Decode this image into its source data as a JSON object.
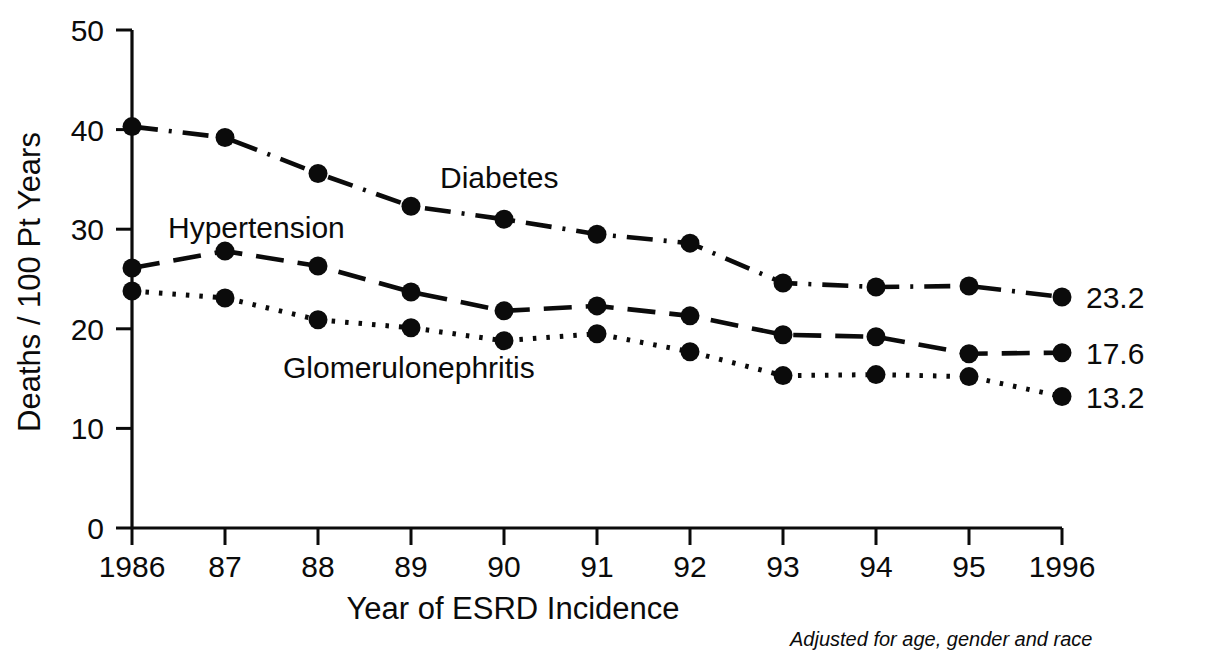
{
  "chart_data": {
    "type": "line",
    "title": "",
    "xlabel": "Year of ESRD Incidence",
    "ylabel": "Deaths / 100 Pt Years",
    "footnote": "Adjusted for age, gender and race",
    "x": [
      1986,
      1987,
      1988,
      1989,
      1990,
      1991,
      1992,
      1993,
      1994,
      1995,
      1996
    ],
    "categories": [
      "1986",
      "87",
      "88",
      "89",
      "90",
      "91",
      "92",
      "93",
      "94",
      "95",
      "1996"
    ],
    "xlim": [
      1986,
      1996
    ],
    "ylim": [
      0,
      50
    ],
    "yticks": [
      "0",
      "10",
      "20",
      "30",
      "40",
      "50"
    ],
    "ytick_values": [
      0,
      10,
      20,
      30,
      40,
      50
    ],
    "grid": false,
    "legend_position": "inline-annotations",
    "series": [
      {
        "name": "Diabetes",
        "line_style": "dash-dot",
        "end_label": "23.2",
        "values": [
          40.3,
          39.2,
          35.6,
          32.3,
          31.0,
          29.5,
          28.6,
          24.6,
          24.2,
          24.3,
          23.2
        ]
      },
      {
        "name": "Hypertension",
        "line_style": "dashed",
        "end_label": "17.6",
        "values": [
          26.1,
          27.8,
          26.3,
          23.7,
          21.8,
          22.3,
          21.3,
          19.4,
          19.2,
          17.5,
          17.6
        ]
      },
      {
        "name": "Glomerulonephritis",
        "line_style": "dotted",
        "end_label": "13.2",
        "values": [
          23.8,
          23.1,
          20.9,
          20.1,
          18.8,
          19.5,
          17.7,
          15.3,
          15.4,
          15.2,
          13.2
        ]
      }
    ],
    "annotations": [
      {
        "text": "Diabetes",
        "x_px": 440,
        "y_px": 188
      },
      {
        "text": "Hypertension",
        "x_px": 168,
        "y_px": 238
      },
      {
        "text": "Glomerulonephritis",
        "x_px": 283,
        "y_px": 378
      }
    ],
    "colors": {
      "ink": "#0b0b0b",
      "background": "#ffffff"
    }
  }
}
